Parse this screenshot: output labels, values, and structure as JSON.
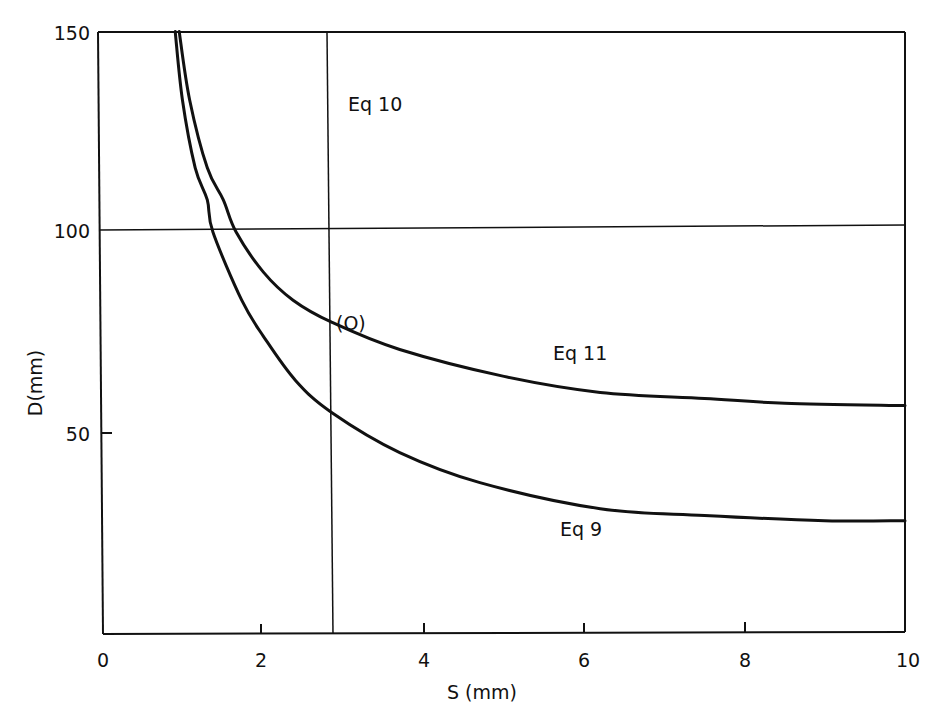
{
  "chart_data": {
    "type": "line",
    "title": "",
    "xlabel": "S (mm)",
    "ylabel": "D(mm)",
    "xlim": [
      0,
      10
    ],
    "ylim": [
      0,
      150
    ],
    "x_ticks": [
      0,
      2,
      4,
      6,
      8,
      10
    ],
    "x_tick_labels": [
      "0",
      "2",
      "4",
      "6",
      "8",
      "10"
    ],
    "y_ticks": [
      50,
      100,
      150
    ],
    "y_tick_labels": [
      "50",
      "100",
      "150"
    ],
    "grid": false,
    "legend": null,
    "series": [
      {
        "name": "Eq 11",
        "x": [
          0.95,
          1.08,
          1.3,
          1.5,
          1.66,
          2.0,
          2.37,
          2.85,
          3.7,
          5.0,
          6.2,
          7.5,
          8.5,
          10.0
        ],
        "y": [
          150,
          133,
          116,
          108,
          100,
          90,
          83,
          77.5,
          70.7,
          64,
          60,
          58.5,
          57.3,
          56.7
        ]
      },
      {
        "name": "Eq 9",
        "x": [
          0.9,
          0.99,
          1.15,
          1.3,
          1.37,
          1.73,
          2.0,
          2.4,
          2.85,
          3.7,
          4.7,
          6.2,
          7.5,
          9.0,
          10.0
        ],
        "y": [
          150,
          133,
          116,
          108,
          100,
          83,
          74,
          63,
          55,
          45,
          37.5,
          31,
          29.3,
          28,
          28
        ]
      }
    ],
    "reference_lines": [
      {
        "name": "Eq 10",
        "orientation": "vertical",
        "x": 2.85
      },
      {
        "name": "D = 100",
        "orientation": "horizontal",
        "y": 100
      }
    ],
    "annotations": [
      {
        "text": "Eq 10",
        "x": 3.0,
        "y": 130
      },
      {
        "text": "(O)",
        "x": 2.9,
        "y": 80
      },
      {
        "text": "Eq 11",
        "x": 5.6,
        "y": 68
      },
      {
        "text": "Eq 9",
        "x": 5.65,
        "y": 24
      }
    ],
    "point_O": {
      "x": 2.85,
      "y": 77.5
    }
  },
  "labels": {
    "xlabel": "S (mm)",
    "ylabel": "D(mm)",
    "eq10": "Eq 10",
    "eq11": "Eq 11",
    "eq9": "Eq 9",
    "point_o": "(O)",
    "xt0": "0",
    "xt2": "2",
    "xt4": "4",
    "xt6": "6",
    "xt8": "8",
    "xt10": "10",
    "yt50": "50",
    "yt100": "100",
    "yt150": "150"
  }
}
